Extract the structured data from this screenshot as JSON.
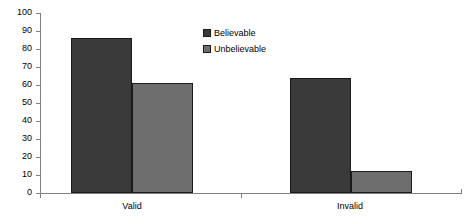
{
  "chart_data": {
    "type": "bar",
    "title": "",
    "subtitle": "",
    "xlabel": "",
    "ylabel": "",
    "categories": [
      "Valid",
      "Invalid"
    ],
    "series": [
      {
        "name": "Believable",
        "values": [
          86,
          64
        ],
        "color": "#3a3a3a"
      },
      {
        "name": "Unbelievable",
        "values": [
          61,
          12
        ],
        "color": "#6e6e6e"
      }
    ],
    "ylim": [
      0,
      100
    ],
    "yticks": [
      0,
      10,
      20,
      30,
      40,
      50,
      60,
      70,
      80,
      90,
      100
    ],
    "ytick_labels": [
      "0",
      "10",
      "20",
      "30",
      "40",
      "50",
      "60",
      "70",
      "80",
      "90",
      "100"
    ],
    "grid": false,
    "legend_position": "top-right",
    "annotations": []
  },
  "legend": {
    "items": [
      {
        "label": "Believable",
        "color": "#3a3a3a"
      },
      {
        "label": "Unbelievable",
        "color": "#6e6e6e"
      }
    ]
  },
  "axis": {
    "y_tick_labels": [
      "100",
      "90",
      "80",
      "70",
      "60",
      "50",
      "40",
      "30",
      "20",
      "10",
      "0"
    ],
    "category_labels": [
      "Valid",
      "Invalid"
    ]
  }
}
